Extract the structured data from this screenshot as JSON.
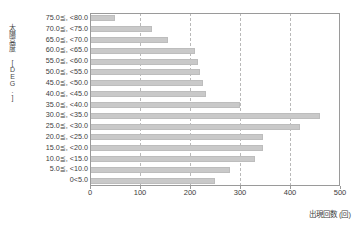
{
  "chart_data": {
    "type": "bar",
    "orientation": "horizontal",
    "title": "",
    "xlabel": "出現回数 (回)",
    "ylabel": "太陽高度 [DEG.]",
    "xlim": [
      0,
      500
    ],
    "ylim": null,
    "grid": true,
    "legend": false,
    "xticks": [
      0,
      100,
      200,
      300,
      400,
      500
    ],
    "xtick_labels": [
      "0",
      "100",
      "200",
      "300",
      "400",
      "500"
    ],
    "categories": [
      "75.0≦, <80.0",
      "70.0≦, <75.0",
      "65.0≦, <70.0",
      "60.0≦, <65.0",
      "55.0≦, <60.0",
      "50.0≦, <55.0",
      "45.0≦, <50.0",
      "40.0≦, <45.0",
      "35.0≦, <40.0",
      "30.0≦, <35.0",
      "25.0≦, <30.0",
      "20.0≦, <25.0",
      "15.0≦, <20.0",
      "10.0≦, <15.0",
      "5.0≦, <10.0",
      "0<5.0"
    ],
    "values": [
      50,
      123,
      155,
      210,
      215,
      220,
      225,
      232,
      300,
      460,
      420,
      345,
      345,
      330,
      280,
      250
    ],
    "bar_color": "#c9c9c9",
    "bar_border_color": "#bdbdbd",
    "gridline_color": "#b9b9b9",
    "axis_color": "#9a9a9a"
  }
}
